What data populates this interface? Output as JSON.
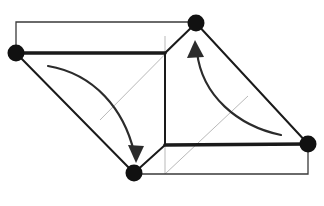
{
  "figure": {
    "canvas": {
      "width": 324,
      "height": 206,
      "background": "#ffffff"
    },
    "colors": {
      "edge_thick": "#1a1a1a",
      "edge_thin": "#3a3a3a",
      "edge_hidden": "#b9b9b9",
      "vertex": "#111111",
      "arrow": "#2b2b2b"
    },
    "stroke_widths": {
      "thick": 3.6,
      "medium": 2.0,
      "thin": 1.3,
      "hidden": 1.0,
      "arrow": 2.2
    },
    "vertices": [
      {
        "id": "v-left",
        "label": "left vertex",
        "x": 16,
        "y": 53,
        "r": 8.5
      },
      {
        "id": "v-top",
        "label": "top vertex",
        "x": 196,
        "y": 23,
        "r": 8.5
      },
      {
        "id": "v-bottom",
        "label": "bottom vertex",
        "x": 134,
        "y": 173,
        "r": 8.5
      },
      {
        "id": "v-right",
        "label": "right vertex",
        "x": 308,
        "y": 144,
        "r": 8.5
      }
    ],
    "thick_edges": [
      {
        "id": "edge-left-to-center-top",
        "name": "upper-left horizontal edge",
        "d": "M 16 53 L 165 53"
      },
      {
        "id": "edge-center-bottom-to-right",
        "name": "lower-right horizontal edge",
        "d": "M 165 145 L 308 144"
      }
    ],
    "medium_edges": [
      {
        "id": "edge-center-vertical",
        "name": "central vertical edge",
        "d": "M 165 53 L 165 145"
      },
      {
        "id": "edge-left-to-bottom",
        "name": "left slanted edge",
        "d": "M 16 53 L 134 173"
      },
      {
        "id": "edge-bottom-to-center",
        "name": "bottom-left slant to center",
        "d": "M 134 173 L 165 145"
      },
      {
        "id": "edge-center-to-top",
        "name": "center to top slant",
        "d": "M 165 53 L 196 23"
      },
      {
        "id": "edge-top-to-right",
        "name": "right slanted edge",
        "d": "M 196 23 L 308 144"
      }
    ],
    "thin_edges": [
      {
        "id": "edge-top-outline",
        "name": "upper thin rectangle outline",
        "d": "M 16 53 L 16 22 L 196 22"
      },
      {
        "id": "edge-bottom-outline",
        "name": "lower thin rectangle outline",
        "d": "M 134 174 L 308 174 L 308 144"
      }
    ],
    "hidden_edges": [
      {
        "id": "hidden-diagonal-upper",
        "name": "upper hidden diagonal",
        "d": "M 100 120 L 196 23"
      },
      {
        "id": "hidden-vertical-upper",
        "name": "upper hidden vertical",
        "d": "M 165 36 L 165 53"
      },
      {
        "id": "hidden-diagonal-lower",
        "name": "lower hidden diagonal",
        "d": "M 165 174 L 248 96"
      },
      {
        "id": "hidden-vertical-lower",
        "name": "lower hidden vertical",
        "d": "M 165 145 L 165 174"
      }
    ],
    "arrows": [
      {
        "id": "arrow-left-down",
        "name": "left curved arrow pointing down-right",
        "direction": "down-right",
        "curve": "M 48 66 C 95 74, 124 110, 134 152",
        "head": "136,163 128,145 144,146"
      },
      {
        "id": "arrow-right-up",
        "name": "right curved arrow pointing up",
        "direction": "up-left",
        "curve": "M 281 135 C 238 126, 202 96, 197 52",
        "head": "195,40 187,58 204,57"
      }
    ]
  }
}
